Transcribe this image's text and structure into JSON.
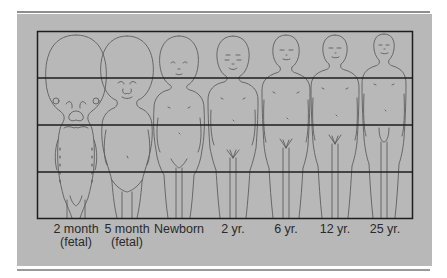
{
  "figure": {
    "grid_rows": 4,
    "colors": {
      "panel": "#b8b8b8",
      "grid_line": "#1e1e1e",
      "outline": "#5a5a5a",
      "rule": "#8e8e8e",
      "text": "#2a2a2a"
    },
    "stages": [
      {
        "label": "2 month",
        "sublabel": "(fetal)",
        "cx": 76
      },
      {
        "label": "5 month",
        "sublabel": "(fetal)",
        "cx": 127
      },
      {
        "label": "Newborn",
        "sublabel": "",
        "cx": 179
      },
      {
        "label": "2 yr.",
        "sublabel": "",
        "cx": 233
      },
      {
        "label": "6 yr.",
        "sublabel": "",
        "cx": 286
      },
      {
        "label": "12 yr.",
        "sublabel": "",
        "cx": 335
      },
      {
        "label": "25 yr.",
        "sublabel": "",
        "cx": 384
      }
    ]
  }
}
